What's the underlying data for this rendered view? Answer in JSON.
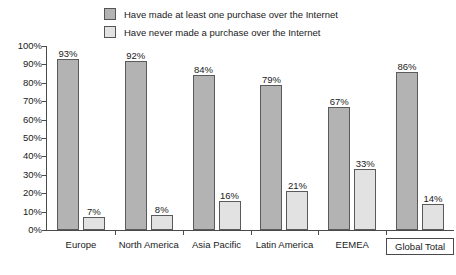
{
  "chart_data": {
    "type": "bar",
    "title": "",
    "subtitle": "",
    "xlabel": "",
    "ylabel": "",
    "ylim": [
      0,
      100
    ],
    "ytick_labels": [
      "100%",
      "90%",
      "80%",
      "70%",
      "60%",
      "50%",
      "40%",
      "30%",
      "20%",
      "10%",
      "0%"
    ],
    "ytick_values": [
      100,
      90,
      80,
      70,
      60,
      50,
      40,
      30,
      20,
      10,
      0
    ],
    "grid": false,
    "legend_position": "top-center",
    "categories": [
      "Europe",
      "North America",
      "Asia Pacific",
      "Latin America",
      "EEMEA",
      "Global Total"
    ],
    "highlighted_category": "Global Total",
    "series": [
      {
        "name": "Have made at least one purchase over the Internet",
        "color": "#b3b3b3",
        "values": [
          93,
          92,
          84,
          79,
          67,
          86
        ],
        "labels": [
          "93%",
          "92%",
          "84%",
          "79%",
          "67%",
          "86%"
        ]
      },
      {
        "name": "Have never made a purchase over the Internet",
        "color": "#e2e2e2",
        "values": [
          7,
          8,
          16,
          21,
          33,
          14
        ],
        "labels": [
          "7%",
          "8%",
          "16%",
          "21%",
          "33%",
          "14%"
        ]
      }
    ]
  },
  "legend": {
    "items": [
      {
        "label": "Have made at least one purchase over the Internet",
        "swatch": "#b3b3b3",
        "icon": "legend-swatch-dark"
      },
      {
        "label": "Have never made a purchase over the Internet",
        "swatch": "#e2e2e2",
        "icon": "legend-swatch-light"
      }
    ]
  },
  "colors": {
    "series_a": "#b3b3b3",
    "series_b": "#e2e2e2",
    "bar_border": "#5a5a5a",
    "axis": "#4a4a4a",
    "text": "#1a1a1a",
    "background": "#ffffff"
  }
}
